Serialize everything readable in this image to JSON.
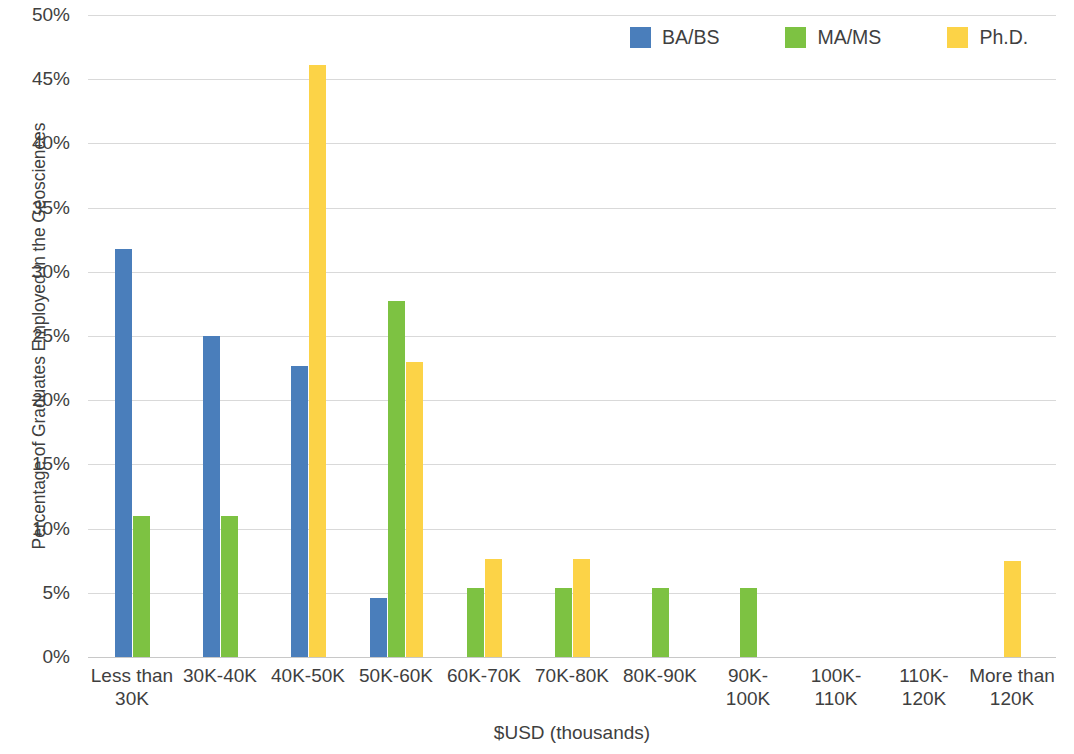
{
  "chart_data": {
    "type": "bar",
    "title": "",
    "xlabel": "$USD (thousands)",
    "ylabel": "Percentage of Graduates Employed in the Geosciences",
    "categories": [
      "Less than 30K",
      "30K-40K",
      "40K-50K",
      "50K-60K",
      "60K-70K",
      "70K-80K",
      "80K-90K",
      "90K-100K",
      "100K-110K",
      "110K-120K",
      "More than 120K"
    ],
    "category_labels": [
      "Less than\n30K",
      "30K-40K",
      "40K-50K",
      "50K-60K",
      "60K-70K",
      "70K-80K",
      "80K-90K",
      "90K-\n100K",
      "100K-\n110K",
      "110K-\n120K",
      "More than\n120K"
    ],
    "series": [
      {
        "name": "BA/BS",
        "color": "#4A7EBB",
        "values": [
          31.8,
          25.0,
          22.7,
          4.6,
          0,
          0,
          0,
          0,
          0,
          0,
          0
        ]
      },
      {
        "name": "MA/MS",
        "color": "#7DC242",
        "values": [
          11.0,
          11.0,
          0,
          27.7,
          5.4,
          5.4,
          5.4,
          5.4,
          0,
          0,
          0
        ]
      },
      {
        "name": "Ph.D.",
        "color": "#FCD347",
        "values": [
          0,
          0,
          46.1,
          23.0,
          7.6,
          7.6,
          0,
          0,
          0,
          0,
          7.5
        ]
      }
    ],
    "ylim": [
      0,
      50
    ],
    "y_tick_values": [
      0,
      5,
      10,
      15,
      20,
      25,
      30,
      35,
      40,
      45,
      50
    ],
    "y_tick_labels": [
      "0%",
      "5%",
      "10%",
      "15%",
      "20%",
      "25%",
      "30%",
      "35%",
      "40%",
      "45%",
      "50%"
    ],
    "y_unit": "%",
    "grid": true,
    "legend_position": "top-right"
  },
  "legend": {
    "items": [
      {
        "label": "BA/BS",
        "color": "#4A7EBB"
      },
      {
        "label": "MA/MS",
        "color": "#7DC242"
      },
      {
        "label": "Ph.D.",
        "color": "#FCD347"
      }
    ]
  },
  "axes": {
    "x_title": "$USD (thousands)",
    "y_title": "Percentage of Graduates Employed in the Geosciences"
  }
}
